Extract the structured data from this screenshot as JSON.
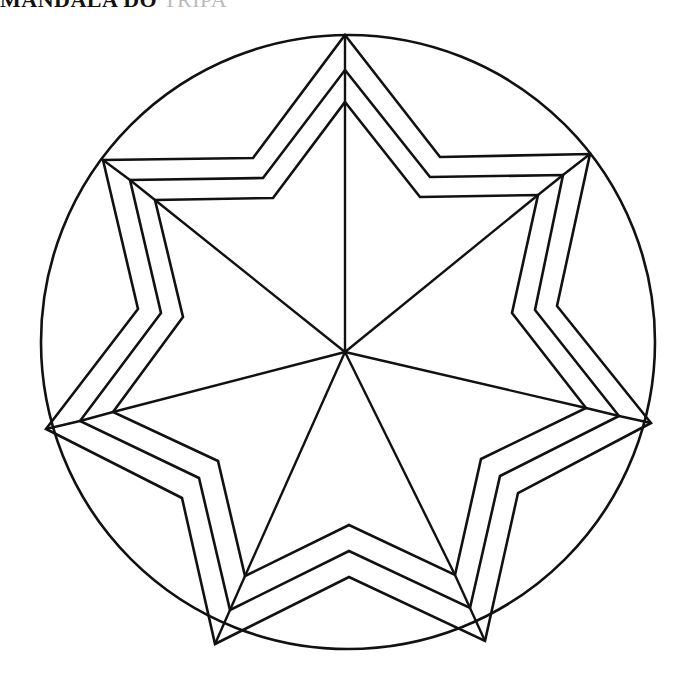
{
  "page": {
    "title_clipped": "MANDALA DO",
    "title_faint": "TRIPA"
  },
  "drawing": {
    "stroke_color": "#111111",
    "background": "#ffffff",
    "circle": {
      "cx": 348,
      "cy": 342,
      "r": 307
    },
    "center": [
      345,
      352
    ],
    "star_layers": [
      {
        "name": "outer",
        "points": [
          [
            345,
            35
          ],
          [
            440,
            157
          ],
          [
            590,
            154
          ],
          [
            557,
            306
          ],
          [
            651,
            423
          ],
          [
            518,
            493
          ],
          [
            485,
            641
          ],
          [
            349,
            577
          ],
          [
            215,
            644
          ],
          [
            182,
            498
          ],
          [
            46,
            429
          ],
          [
            138,
            309
          ],
          [
            103,
            160
          ],
          [
            253,
            158
          ]
        ]
      },
      {
        "name": "middle",
        "points": [
          [
            345,
            70
          ],
          [
            430,
            177
          ],
          [
            563,
            175
          ],
          [
            535,
            310
          ],
          [
            619,
            416
          ],
          [
            500,
            476
          ],
          [
            470,
            608
          ],
          [
            349,
            551
          ],
          [
            230,
            610
          ],
          [
            199,
            478
          ],
          [
            80,
            421
          ],
          [
            161,
            313
          ],
          [
            130,
            180
          ],
          [
            263,
            178
          ]
        ]
      },
      {
        "name": "inner",
        "points": [
          [
            345,
            102
          ],
          [
            420,
            197
          ],
          [
            538,
            195
          ],
          [
            512,
            313
          ],
          [
            586,
            408
          ],
          [
            481,
            459
          ],
          [
            455,
            575
          ],
          [
            349,
            525
          ],
          [
            245,
            576
          ],
          [
            218,
            461
          ],
          [
            113,
            412
          ],
          [
            183,
            317
          ],
          [
            155,
            200
          ],
          [
            273,
            198
          ]
        ]
      }
    ]
  }
}
